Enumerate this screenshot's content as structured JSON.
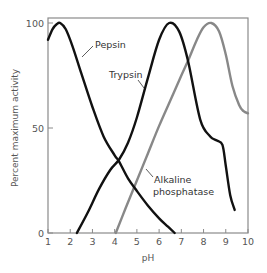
{
  "chart_data": {
    "type": "line",
    "title": "",
    "xlabel": "pH",
    "ylabel": "Percent maximum activity",
    "xlim": [
      1,
      10
    ],
    "ylim": [
      0,
      100
    ],
    "grid": false,
    "legend": "none (inline labels)",
    "x_ticks": [
      1,
      2,
      3,
      4,
      5,
      6,
      7,
      8,
      9,
      10
    ],
    "x_tick_labels": [
      "1",
      "2",
      "3",
      "4",
      "5",
      "6",
      "7",
      "8",
      "9",
      "10"
    ],
    "y_ticks": [
      0,
      50,
      100
    ],
    "y_tick_labels": [
      "0",
      "50",
      "100"
    ],
    "series": [
      {
        "name": "Pepsin",
        "label": "Pepsin",
        "color": "#111111",
        "x": [
          1.0,
          1.2,
          1.4,
          1.55,
          1.8,
          2.1,
          2.5,
          3.0,
          3.5,
          4.0,
          4.2,
          4.6,
          5.0,
          5.5,
          6.0,
          6.4,
          6.7
        ],
        "y": [
          92,
          97,
          99.5,
          100,
          97,
          89,
          76,
          60,
          46,
          37,
          34,
          26,
          20,
          13,
          7,
          3,
          0
        ]
      },
      {
        "name": "Trypsin",
        "label": "Trypsin",
        "color": "#111111",
        "x": [
          2.3,
          2.8,
          3.3,
          3.8,
          4.2,
          4.6,
          5.0,
          5.5,
          6.0,
          6.45,
          6.9,
          7.3,
          7.85,
          8.3,
          8.6,
          8.85,
          9.0,
          9.2,
          9.4
        ],
        "y": [
          0,
          10,
          21,
          30,
          35,
          43,
          55,
          74,
          92,
          100,
          96,
          82,
          54,
          46,
          44,
          42,
          32,
          18,
          11
        ]
      },
      {
        "name": "Alkaline phosphatase",
        "label": "Alkaline phosphatase",
        "color": "#888888",
        "x": [
          4.05,
          4.5,
          5.0,
          5.5,
          6.0,
          6.5,
          7.0,
          7.3,
          7.7,
          8.0,
          8.35,
          8.7,
          9.0,
          9.3,
          9.6,
          9.8,
          10.0
        ],
        "y": [
          0,
          12,
          25,
          38,
          51,
          63,
          75,
          82,
          92,
          98,
          100,
          96,
          85,
          70,
          61,
          58,
          57
        ]
      }
    ],
    "annotations": [
      {
        "text": "Pepsin",
        "points_to_series": "Pepsin"
      },
      {
        "text": "Trypsin",
        "points_to_series": "Trypsin"
      },
      {
        "text": "Alkaline",
        "points_to_series": "Alkaline phosphatase"
      },
      {
        "text": "phosphatase",
        "points_to_series": "Alkaline phosphatase"
      }
    ]
  }
}
